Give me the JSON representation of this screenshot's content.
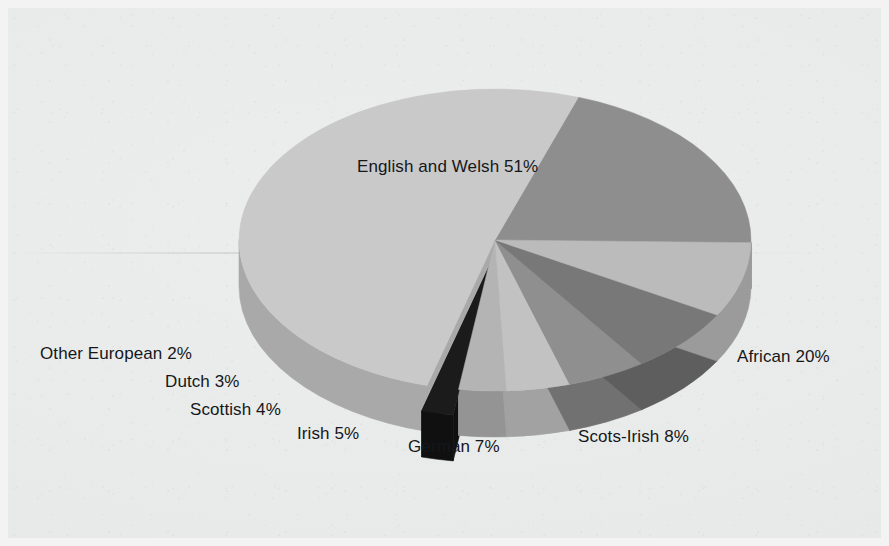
{
  "figure": {
    "background_color": "#e9ebea",
    "label_color": "#15171a"
  },
  "chart_data": {
    "type": "pie",
    "title": "",
    "xlabel": "",
    "ylabel": "",
    "style": "3d-exploded-pie",
    "grid": false,
    "legend_position": "none",
    "labels_placement": "around-pie",
    "total_percent": 100,
    "categories": [
      "African",
      "English and Welsh",
      "Other European",
      "Dutch",
      "Scottish",
      "Irish",
      "German",
      "Scots-Irish"
    ],
    "values": [
      20,
      51,
      2,
      3,
      4,
      5,
      7,
      8
    ],
    "slices": [
      {
        "name": "african",
        "label": "African 20%",
        "category": "African",
        "value": 20,
        "percent_text": "20%",
        "color": "#8e8e8e",
        "side_color": "#6f6f6f",
        "exploded": false
      },
      {
        "name": "english-and-welsh",
        "label": "English and Welsh 51%",
        "category": "English and Welsh",
        "value": 51,
        "percent_text": "51%",
        "color": "#c9c9c9",
        "side_color": "#a9a9a9",
        "exploded": false
      },
      {
        "name": "other-european",
        "label": "Other European 2%",
        "category": "Other European",
        "value": 2,
        "percent_text": "2%",
        "color": "#1b1b1b",
        "side_color": "#101010",
        "exploded": true
      },
      {
        "name": "dutch",
        "label": "Dutch 3%",
        "category": "Dutch",
        "value": 3,
        "percent_text": "3%",
        "color": "#b4b4b4",
        "side_color": "#949494",
        "exploded": false
      },
      {
        "name": "scottish",
        "label": "Scottish 4%",
        "category": "Scottish",
        "value": 4,
        "percent_text": "4%",
        "color": "#c2c2c2",
        "side_color": "#a2a2a2",
        "exploded": false
      },
      {
        "name": "irish",
        "label": "Irish 5%",
        "category": "Irish",
        "value": 5,
        "percent_text": "5%",
        "color": "#8f8f8f",
        "side_color": "#717171",
        "exploded": false
      },
      {
        "name": "german",
        "label": "German 7%",
        "category": "German",
        "value": 7,
        "percent_text": "7%",
        "color": "#787878",
        "side_color": "#5e5e5e",
        "exploded": false
      },
      {
        "name": "scots-irish",
        "label": "Scots-Irish 8%",
        "category": "Scots-Irish",
        "value": 8,
        "percent_text": "8%",
        "color": "#bbbbbb",
        "side_color": "#9b9b9b",
        "exploded": false
      }
    ]
  },
  "labels": {
    "english_and_welsh": "English and Welsh 51%",
    "african": "African 20%",
    "scots_irish": "Scots-Irish 8%",
    "german": "German 7%",
    "irish": "Irish 5%",
    "scottish": "Scottish 4%",
    "dutch": "Dutch 3%",
    "other_european": "Other European 2%"
  }
}
